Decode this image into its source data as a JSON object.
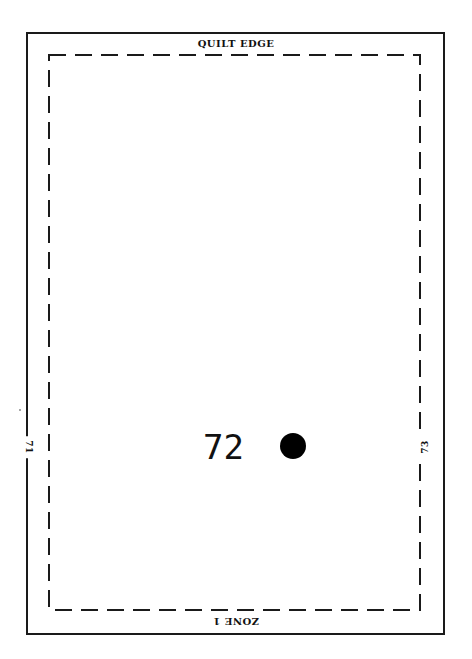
{
  "diagram": {
    "top_edge_label": "QUILT EDGE",
    "bottom_edge_label": "ZONE 1",
    "left_edge_label": "71",
    "right_edge_label": "73",
    "block_number": "72",
    "marker": "filled-circle",
    "colors": {
      "line": "#1a1a1a",
      "background": "#ffffff",
      "dot": "#000000"
    }
  }
}
